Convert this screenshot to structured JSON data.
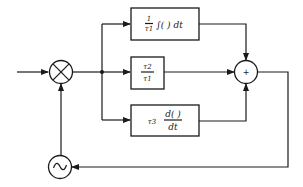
{
  "diagram": {
    "type": "block-diagram",
    "nodes": {
      "multiplier": {
        "symbol": "⊗",
        "label": "multiplier"
      },
      "summer": {
        "symbol": "+",
        "label": "summing junction"
      },
      "oscillator": {
        "symbol": "~",
        "label": "oscillator"
      }
    },
    "blocks": [
      {
        "id": "integral",
        "coef_num": "1",
        "coef_den": "τ1",
        "operator": "∫( ) dt"
      },
      {
        "id": "proportional",
        "coef_num": "τ2",
        "coef_den": "τ1"
      },
      {
        "id": "derivative",
        "coef": "τ3",
        "op_num": "d( )",
        "op_den": "dt"
      }
    ],
    "edges": [
      {
        "from": "input",
        "to": "multiplier"
      },
      {
        "from": "multiplier",
        "to": "junction"
      },
      {
        "from": "junction",
        "to": "integral"
      },
      {
        "from": "junction",
        "to": "proportional"
      },
      {
        "from": "junction",
        "to": "derivative"
      },
      {
        "from": "integral",
        "to": "summer"
      },
      {
        "from": "proportional",
        "to": "summer"
      },
      {
        "from": "derivative",
        "to": "summer"
      },
      {
        "from": "summer",
        "to": "oscillator"
      },
      {
        "from": "oscillator",
        "to": "multiplier"
      }
    ]
  }
}
